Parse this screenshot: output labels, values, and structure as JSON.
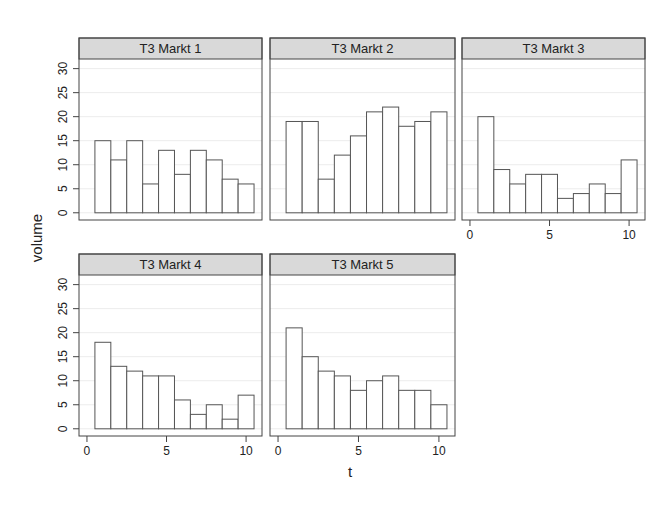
{
  "chart_data": {
    "type": "bar",
    "layout": "lattice-trellis",
    "xlabel": "t",
    "ylabel": "volume",
    "xlim": [
      -0.5,
      11.0
    ],
    "ylim": [
      -1.5,
      32
    ],
    "x_ticks": [
      0,
      5,
      10
    ],
    "y_ticks": [
      0,
      5,
      10,
      15,
      20,
      25,
      30
    ],
    "x": [
      1,
      2,
      3,
      4,
      5,
      6,
      7,
      8,
      9,
      10
    ],
    "grid": true,
    "bar_fill": "#ffffff",
    "bar_stroke": "#555555",
    "strip_fill": "#d9d9d9",
    "panels": [
      {
        "title": "T3 Markt 1",
        "values": [
          15,
          11,
          15,
          6,
          13,
          8,
          13,
          11,
          7,
          6
        ]
      },
      {
        "title": "T3 Markt 2",
        "values": [
          19,
          19,
          7,
          12,
          16,
          21,
          22,
          18,
          19,
          21
        ]
      },
      {
        "title": "T3 Markt 3",
        "values": [
          20,
          9,
          6,
          8,
          8,
          3,
          4,
          6,
          4,
          11
        ]
      },
      {
        "title": "T3 Markt 4",
        "values": [
          18,
          13,
          12,
          11,
          11,
          6,
          3,
          5,
          2,
          7
        ]
      },
      {
        "title": "T3 Markt 5",
        "values": [
          21,
          15,
          12,
          11,
          8,
          10,
          11,
          8,
          8,
          5
        ]
      }
    ]
  }
}
